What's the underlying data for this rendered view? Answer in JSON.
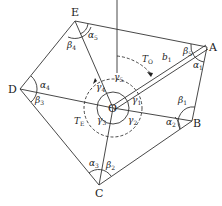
{
  "diagram": {
    "type": "traverse polygon with central station",
    "stroke_color": "#333333",
    "vertices": {
      "A": {
        "label": "A",
        "x": 207,
        "y": 47
      },
      "B": {
        "label": "B",
        "x": 192,
        "y": 121
      },
      "C": {
        "label": "C",
        "x": 99,
        "y": 185
      },
      "D": {
        "label": "D",
        "x": 20,
        "y": 89
      },
      "E": {
        "label": "E",
        "x": 75,
        "y": 21
      },
      "O": {
        "label": "O",
        "x": 113,
        "y": 108
      }
    },
    "edges": [
      "A-B",
      "B-C",
      "C-D",
      "D-E",
      "E-A",
      "O-A",
      "O-B",
      "O-C",
      "O-D",
      "O-E"
    ],
    "labels": {
      "alpha1": {
        "base": "α",
        "sub": "1"
      },
      "alpha2": {
        "base": "α",
        "sub": "2"
      },
      "alpha3": {
        "base": "α",
        "sub": "3"
      },
      "alpha4": {
        "base": "α",
        "sub": "4"
      },
      "alpha5": {
        "base": "α",
        "sub": "5"
      },
      "beta1": {
        "base": "β",
        "sub": "1"
      },
      "beta2": {
        "base": "β",
        "sub": "2"
      },
      "beta3": {
        "base": "β",
        "sub": "3"
      },
      "beta4": {
        "base": "β",
        "sub": "4"
      },
      "beta5": {
        "base": "β",
        "sub": "5"
      },
      "gamma1": {
        "base": "γ",
        "sub": "1"
      },
      "gamma2": {
        "base": "γ",
        "sub": "2"
      },
      "gamma3": {
        "base": "γ",
        "sub": "3"
      },
      "gamma4": {
        "base": "γ",
        "sub": "4"
      },
      "gamma5": {
        "base": "γ",
        "sub": "5"
      },
      "b1": {
        "base": "b",
        "sub": "1"
      },
      "TO": {
        "base": "T",
        "sub": "O"
      },
      "TE": {
        "base": "T",
        "sub": "E"
      }
    }
  }
}
